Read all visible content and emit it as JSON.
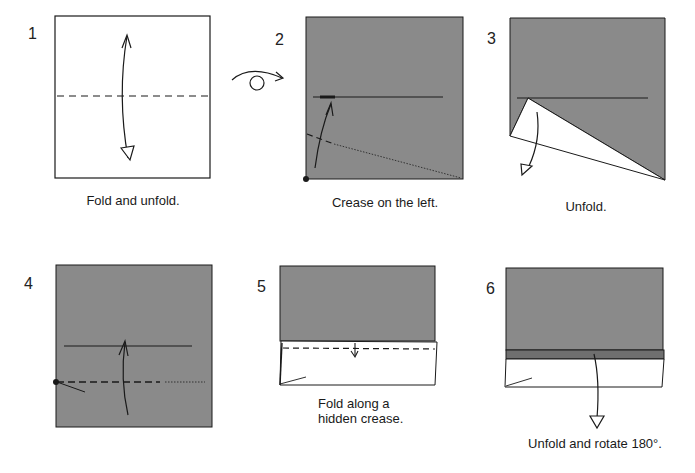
{
  "diagram": {
    "type": "origami-instructions",
    "colors": {
      "paper_colored": "#8a8a8a",
      "paper_white": "#ffffff",
      "line": "#1a1a1a",
      "band": "#6f6f6f"
    },
    "turn_over_symbol": "turn-over-icon",
    "steps": [
      {
        "number": "1",
        "caption": "Fold and unfold."
      },
      {
        "number": "2",
        "caption": "Crease on the left."
      },
      {
        "number": "3",
        "caption": "Unfold."
      },
      {
        "number": "4",
        "caption": ""
      },
      {
        "number": "5",
        "caption_line1": "Fold along a",
        "caption_line2": "hidden crease."
      },
      {
        "number": "6",
        "caption": "Unfold and rotate 180°."
      }
    ]
  }
}
